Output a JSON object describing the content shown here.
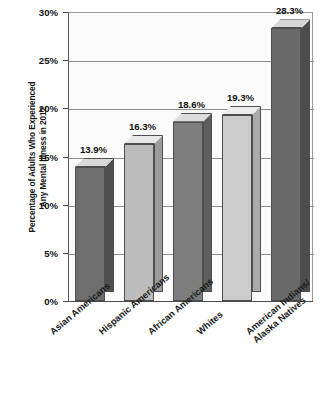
{
  "chart_data": {
    "type": "bar",
    "title": "",
    "subtitle": "",
    "xlabel": "",
    "ylabel": "Percentage of Adults Who Experienced Any Mental Illness in 2012",
    "ylabel_lines": [
      "Percentage of Adults Who Experienced",
      "Any Mental Illness in 2012"
    ],
    "categories": [
      "Asian Americans",
      "Hispanic Americans",
      "African Americans",
      "Whites",
      "American Indians/ Alaska Natives"
    ],
    "category_lines": [
      [
        "Asian Americans"
      ],
      [
        "Hispanic Americans"
      ],
      [
        "African Americans"
      ],
      [
        "Whites"
      ],
      [
        "American Indians/",
        "Alaska Natives"
      ]
    ],
    "values": [
      13.9,
      16.3,
      18.6,
      19.3,
      28.3
    ],
    "value_labels": [
      "13.9%",
      "16.3%",
      "18.6%",
      "19.3%",
      "28.3%"
    ],
    "ylim": [
      0,
      30
    ],
    "ytick_values": [
      0,
      5,
      10,
      15,
      20,
      25,
      30
    ],
    "ytick_labels": [
      "0%",
      "5%",
      "10%",
      "15%",
      "20%",
      "25%",
      "30%"
    ],
    "grid": true,
    "grid_axis": "y",
    "legend": false,
    "legend_position": "none",
    "bar_style": "3d",
    "bar_colors": [
      "#6e6e6e",
      "#bcbcbc",
      "#7d7d7d",
      "#cccccc",
      "#6a6a6a"
    ],
    "bar_top_colors": [
      "#d9d9d9",
      "#e8e8e8",
      "#dcdcdc",
      "#ececec",
      "#d6d6d6"
    ],
    "bar_side_colors": [
      "#4f4f4f",
      "#9b9b9b",
      "#5e5e5e",
      "#aaaaaa",
      "#4c4c4c"
    ],
    "plot_background": "#fbfbfb",
    "grid_color": "#8e8e8e",
    "axis_color": "#4a4a4a"
  }
}
